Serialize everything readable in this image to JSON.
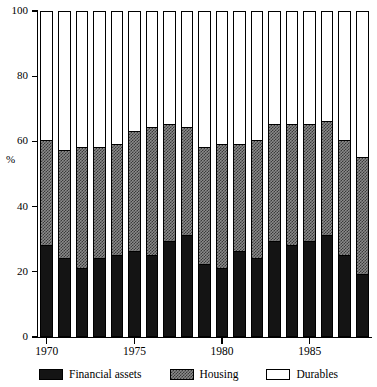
{
  "chart_data": {
    "type": "bar",
    "stacked": true,
    "title": "",
    "subtitle": "",
    "xlabel": "",
    "ylabel": "%",
    "ylim": [
      0,
      100
    ],
    "yticks": [
      0,
      20,
      40,
      60,
      80,
      100
    ],
    "xlim": [
      1969.5,
      1988.5
    ],
    "xticks": [
      1970,
      1975,
      1980,
      1985
    ],
    "xticklabels": [
      "1970",
      "1975",
      "1980",
      "1985"
    ],
    "grid": false,
    "legend_position": "bottom",
    "categories": [
      "1970",
      "1971",
      "1972",
      "1973",
      "1974",
      "1975",
      "1976",
      "1977",
      "1978",
      "1979",
      "1980",
      "1981",
      "1982",
      "1983",
      "1984",
      "1985",
      "1986",
      "1987",
      "1988"
    ],
    "series": [
      {
        "name": "Financial assets",
        "color": "#141414",
        "values": [
          28,
          24,
          21,
          24,
          25,
          26,
          25,
          29,
          31,
          22,
          21,
          26,
          24,
          29,
          28,
          29,
          31,
          25,
          19
        ]
      },
      {
        "name": "Housing",
        "color": "#8a8a8a",
        "values": [
          32,
          33,
          37,
          34,
          34,
          37,
          39,
          36,
          33,
          36,
          38,
          33,
          36,
          36,
          37,
          36,
          35,
          35,
          36
        ]
      },
      {
        "name": "Durables",
        "color": "#ffffff",
        "values": [
          40,
          43,
          42,
          42,
          41,
          37,
          36,
          35,
          36,
          42,
          41,
          41,
          40,
          35,
          35,
          35,
          34,
          40,
          45
        ]
      }
    ],
    "cumulative_tops": {
      "financial_assets": [
        28,
        24,
        21,
        24,
        25,
        26,
        25,
        29,
        31,
        22,
        21,
        26,
        24,
        29,
        28,
        29,
        31,
        25,
        19
      ],
      "financial_plus_housing": [
        60,
        57,
        58,
        58,
        59,
        63,
        64,
        65,
        64,
        58,
        59,
        59,
        60,
        65,
        65,
        65,
        66,
        60,
        55
      ]
    }
  },
  "axis": {
    "y_title": "%",
    "y_tick_labels": [
      "0",
      "20",
      "40",
      "60",
      "80",
      "100"
    ],
    "x_tick_labels": [
      "1970",
      "1975",
      "1980",
      "1985"
    ]
  },
  "legend": {
    "items": [
      {
        "label": "Financial assets",
        "swatch": "black-solid-swatch"
      },
      {
        "label": "Housing",
        "swatch": "gray-checkered-swatch"
      },
      {
        "label": "Durables",
        "swatch": "white-outline-swatch"
      }
    ]
  }
}
